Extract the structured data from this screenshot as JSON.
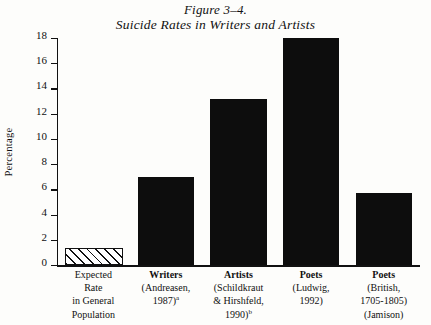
{
  "title": {
    "figure_number": "Figure 3–4.",
    "caption": "Suicide Rates in Writers and Artists"
  },
  "axes": {
    "ylabel": "Percentage",
    "yticks": [
      "0",
      "2",
      "4",
      "6",
      "8",
      "10",
      "12",
      "14",
      "16",
      "18"
    ]
  },
  "chart_data": {
    "type": "bar",
    "title": "Suicide Rates in Writers and Artists",
    "xlabel": "",
    "ylabel": "Percentage",
    "ylim": [
      0,
      18
    ],
    "ytick_values": [
      0,
      2,
      4,
      6,
      8,
      10,
      12,
      14,
      16,
      18
    ],
    "grid": false,
    "legend": "none",
    "categories": [
      "Expected Rate in General Population",
      "Writers (Andreasen, 1987)a",
      "Artists (Schildkraut & Hirshfeld, 1990)b",
      "Poets (Ludwig, 1992)",
      "Poets (British, 1705-1805) (Jamison)"
    ],
    "values": [
      1.2,
      7.0,
      13.2,
      18.0,
      5.7
    ],
    "bar_styles": [
      "hatched",
      "solid",
      "solid",
      "solid",
      "solid"
    ]
  },
  "categories": [
    {
      "lines": [
        "Expected",
        "Rate",
        "in General",
        "Population"
      ],
      "bold_first": false,
      "superscript": ""
    },
    {
      "lines": [
        "Writers",
        "(Andreasen,",
        "1987)"
      ],
      "bold_first": true,
      "superscript": "a"
    },
    {
      "lines": [
        "Artists",
        "(Schildkraut",
        "& Hirshfeld,",
        "1990)"
      ],
      "bold_first": true,
      "superscript": "b"
    },
    {
      "lines": [
        "Poets",
        "(Ludwig,",
        "1992)"
      ],
      "bold_first": true,
      "superscript": ""
    },
    {
      "lines": [
        "Poets",
        "(British,",
        "1705-1805)",
        "(Jamison)"
      ],
      "bold_first": true,
      "superscript": ""
    }
  ],
  "colors": {
    "bar_fill": "#0d0d0d",
    "axis": "#111111",
    "background": "#fdfdfb"
  }
}
